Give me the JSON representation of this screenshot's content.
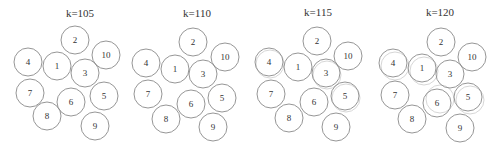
{
  "figure": {
    "radius": 14,
    "colors": {
      "stroke": "#8a8a8a",
      "ghost_stroke": "#c4c4c4",
      "text": "#333333",
      "background": "#ffffff"
    },
    "panels": [
      {
        "title": "k=105",
        "title_x": 80,
        "title_y": 17,
        "circles": [
          {
            "label": "2",
            "x": 75,
            "y": 40
          },
          {
            "label": "10",
            "x": 106,
            "y": 55
          },
          {
            "label": "4",
            "x": 28,
            "y": 62
          },
          {
            "label": "1",
            "x": 57,
            "y": 66
          },
          {
            "label": "3",
            "x": 85,
            "y": 73
          },
          {
            "label": "7",
            "x": 30,
            "y": 93
          },
          {
            "label": "6",
            "x": 71,
            "y": 102
          },
          {
            "label": "5",
            "x": 104,
            "y": 96
          },
          {
            "label": "8",
            "x": 47,
            "y": 116
          },
          {
            "label": "9",
            "x": 95,
            "y": 126
          }
        ],
        "ghosts": []
      },
      {
        "title": "k=110",
        "title_x": 197,
        "title_y": 17,
        "circles": [
          {
            "label": "2",
            "x": 193,
            "y": 42
          },
          {
            "label": "10",
            "x": 225,
            "y": 57
          },
          {
            "label": "4",
            "x": 146,
            "y": 63
          },
          {
            "label": "1",
            "x": 175,
            "y": 69
          },
          {
            "label": "3",
            "x": 203,
            "y": 74
          },
          {
            "label": "7",
            "x": 148,
            "y": 94
          },
          {
            "label": "6",
            "x": 191,
            "y": 104
          },
          {
            "label": "5",
            "x": 222,
            "y": 98
          },
          {
            "label": "8",
            "x": 166,
            "y": 119
          },
          {
            "label": "9",
            "x": 213,
            "y": 127
          }
        ],
        "ghosts": []
      },
      {
        "title": "k=115",
        "title_x": 318,
        "title_y": 16,
        "circles": [
          {
            "label": "2",
            "x": 317,
            "y": 41
          },
          {
            "label": "10",
            "x": 348,
            "y": 56
          },
          {
            "label": "4",
            "x": 269,
            "y": 62
          },
          {
            "label": "1",
            "x": 298,
            "y": 67
          },
          {
            "label": "3",
            "x": 326,
            "y": 73
          },
          {
            "label": "7",
            "x": 271,
            "y": 94
          },
          {
            "label": "6",
            "x": 314,
            "y": 102
          },
          {
            "label": "5",
            "x": 345,
            "y": 96
          },
          {
            "label": "8",
            "x": 289,
            "y": 118
          },
          {
            "label": "9",
            "x": 336,
            "y": 127
          }
        ],
        "ghosts": [
          {
            "x": 270,
            "y": 64
          },
          {
            "x": 346,
            "y": 98
          },
          {
            "x": 327,
            "y": 75
          }
        ]
      },
      {
        "title": "k=120",
        "title_x": 440,
        "title_y": 16,
        "circles": [
          {
            "label": "2",
            "x": 441,
            "y": 42
          },
          {
            "label": "10",
            "x": 472,
            "y": 57
          },
          {
            "label": "4",
            "x": 393,
            "y": 63
          },
          {
            "label": "1",
            "x": 422,
            "y": 68
          },
          {
            "label": "3",
            "x": 450,
            "y": 74
          },
          {
            "label": "7",
            "x": 395,
            "y": 95
          },
          {
            "label": "6",
            "x": 437,
            "y": 103
          },
          {
            "label": "5",
            "x": 468,
            "y": 97
          },
          {
            "label": "8",
            "x": 412,
            "y": 119
          },
          {
            "label": "9",
            "x": 460,
            "y": 128
          }
        ],
        "ghosts": [
          {
            "x": 395,
            "y": 66
          },
          {
            "x": 424,
            "y": 71
          },
          {
            "x": 440,
            "y": 99
          },
          {
            "x": 470,
            "y": 100
          }
        ]
      }
    ]
  }
}
